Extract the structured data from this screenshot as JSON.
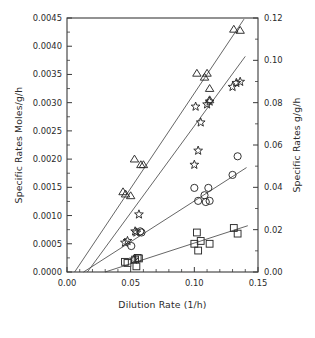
{
  "chart_data": {
    "type": "scatter",
    "title": "",
    "xlabel": "Dilution Rate (1/h)",
    "ylabel": "Specific Rates Moles/g/h",
    "ylabel_right": "Specific Rates g/g/h",
    "xlim": [
      0.0,
      0.15
    ],
    "ylim": [
      0.0,
      0.0045
    ],
    "ylim_right": [
      0.0,
      0.12
    ],
    "xticks": [
      0.0,
      0.05,
      0.1,
      0.15
    ],
    "xticklabels": [
      "0.00",
      "0.05",
      "0.10",
      "0.15"
    ],
    "x_minor_tick_step": 0.01,
    "yticks": [
      0.0,
      0.0005,
      0.001,
      0.0015,
      0.002,
      0.0025,
      0.003,
      0.0035,
      0.004,
      0.0045
    ],
    "yticklabels": [
      "0.0000",
      "0.0005",
      "0.0010",
      "0.0015",
      "0.0020",
      "0.0025",
      "0.0030",
      "0.0035",
      "0.0040",
      "0.0045"
    ],
    "yticks_right": [
      0.0,
      0.02,
      0.04,
      0.06,
      0.08,
      0.1,
      0.12
    ],
    "yticklabels_right": [
      "0.00",
      "0.02",
      "0.04",
      "0.06",
      "0.08",
      "0.10",
      "0.12"
    ],
    "grid": false,
    "legend": "none",
    "marker_fill": "none",
    "marker_edge_color": "#2a2a2a",
    "line_color": "#4a4a4a",
    "axis_color": "#3a3a3a",
    "series": [
      {
        "name": "triangle-series",
        "marker": "triangle-up-open",
        "axis": "left",
        "points": [
          {
            "x": 0.044,
            "y": 0.00142
          },
          {
            "x": 0.046,
            "y": 0.00138
          },
          {
            "x": 0.05,
            "y": 0.00135
          },
          {
            "x": 0.053,
            "y": 0.002
          },
          {
            "x": 0.058,
            "y": 0.0019
          },
          {
            "x": 0.06,
            "y": 0.0019
          },
          {
            "x": 0.102,
            "y": 0.00352
          },
          {
            "x": 0.108,
            "y": 0.00345
          },
          {
            "x": 0.11,
            "y": 0.00352
          },
          {
            "x": 0.112,
            "y": 0.00325
          },
          {
            "x": 0.112,
            "y": 0.00305
          },
          {
            "x": 0.131,
            "y": 0.0043
          },
          {
            "x": 0.136,
            "y": 0.00428
          }
        ],
        "fit_line": {
          "x_start": 0.006,
          "y_start": 0.0,
          "x_end": 0.139,
          "y_end": 0.00448
        }
      },
      {
        "name": "star-series",
        "marker": "star-open",
        "axis": "left",
        "points": [
          {
            "x": 0.0455,
            "y": 0.00052
          },
          {
            "x": 0.0475,
            "y": 0.00055
          },
          {
            "x": 0.0535,
            "y": 0.00072
          },
          {
            "x": 0.0545,
            "y": 0.0007
          },
          {
            "x": 0.0565,
            "y": 0.00102
          },
          {
            "x": 0.0525,
            "y": 0.00022
          },
          {
            "x": 0.1,
            "y": 0.0019
          },
          {
            "x": 0.103,
            "y": 0.00215
          },
          {
            "x": 0.105,
            "y": 0.00265
          },
          {
            "x": 0.101,
            "y": 0.00293
          },
          {
            "x": 0.11,
            "y": 0.00297
          },
          {
            "x": 0.112,
            "y": 0.00302
          },
          {
            "x": 0.13,
            "y": 0.00328
          },
          {
            "x": 0.133,
            "y": 0.00335
          },
          {
            "x": 0.136,
            "y": 0.00337
          }
        ],
        "fit_line": {
          "x_start": 0.016,
          "y_start": 0.0,
          "x_end": 0.14,
          "y_end": 0.00382
        }
      },
      {
        "name": "circle-series",
        "marker": "circle-open",
        "axis": "left",
        "points": [
          {
            "x": 0.0505,
            "y": 0.00046
          },
          {
            "x": 0.0575,
            "y": 0.00072
          },
          {
            "x": 0.0585,
            "y": 0.0007
          },
          {
            "x": 0.1,
            "y": 0.00149
          },
          {
            "x": 0.103,
            "y": 0.00126
          },
          {
            "x": 0.108,
            "y": 0.00136
          },
          {
            "x": 0.109,
            "y": 0.00124
          },
          {
            "x": 0.111,
            "y": 0.00149
          },
          {
            "x": 0.112,
            "y": 0.00126
          },
          {
            "x": 0.13,
            "y": 0.00172
          },
          {
            "x": 0.134,
            "y": 0.00205
          }
        ],
        "fit_line": {
          "x_start": 0.013,
          "y_start": 0.0,
          "x_end": 0.141,
          "y_end": 0.00185
        }
      },
      {
        "name": "square-series",
        "marker": "square-open",
        "axis": "left",
        "points": [
          {
            "x": 0.0455,
            "y": 0.00018
          },
          {
            "x": 0.0475,
            "y": 0.00016
          },
          {
            "x": 0.0535,
            "y": 0.00022
          },
          {
            "x": 0.0555,
            "y": 0.00025
          },
          {
            "x": 0.0565,
            "y": 0.00024
          },
          {
            "x": 0.0545,
            "y": 0.0001
          },
          {
            "x": 0.1,
            "y": 0.0005
          },
          {
            "x": 0.103,
            "y": 0.00038
          },
          {
            "x": 0.105,
            "y": 0.00055
          },
          {
            "x": 0.102,
            "y": 0.0007
          },
          {
            "x": 0.112,
            "y": 0.0005
          },
          {
            "x": 0.131,
            "y": 0.00078
          },
          {
            "x": 0.134,
            "y": 0.00068
          }
        ],
        "fit_line": {
          "x_start": 0.03,
          "y_start": 0.0,
          "x_end": 0.142,
          "y_end": 0.00082
        }
      }
    ]
  }
}
